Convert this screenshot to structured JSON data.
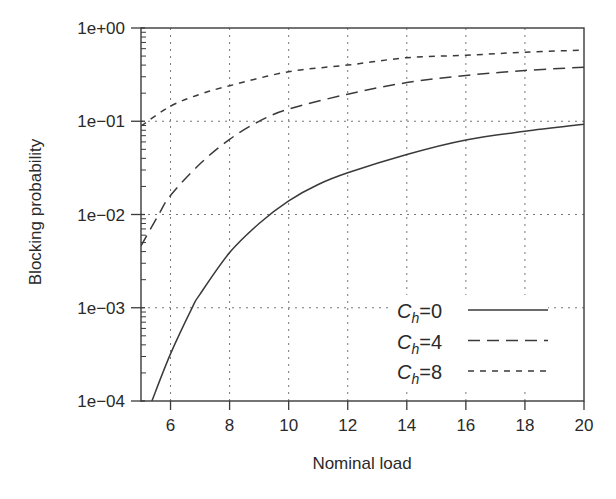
{
  "chart_data": {
    "type": "line",
    "title": "",
    "xlabel": "Nominal load",
    "ylabel": "Blocking probability",
    "xlim": [
      5,
      20
    ],
    "ylim": [
      0.0001,
      1
    ],
    "yscale": "log",
    "grid": true,
    "legend_position": "lower right",
    "x_ticks": [
      6,
      8,
      10,
      12,
      14,
      16,
      18,
      20
    ],
    "x_tick_labels": [
      "6",
      "8",
      "10",
      "12",
      "14",
      "16",
      "18",
      "20"
    ],
    "y_ticks": [
      1,
      0.1,
      0.01,
      0.001,
      0.0001
    ],
    "y_tick_labels": [
      "1e+00",
      "1e−01",
      "1e−02",
      "1e−03",
      "1e−04"
    ],
    "series": [
      {
        "name": "C_h=0",
        "label_main": "C",
        "label_sub": "h",
        "label_rest": "=0",
        "style": "solid",
        "color": "#3a3a3a",
        "x": [
          5.37,
          6,
          6.73,
          7,
          8,
          9,
          10,
          11,
          12,
          14,
          16,
          18,
          20
        ],
        "values": [
          0.0001,
          0.00032,
          0.001,
          0.0014,
          0.0039,
          0.008,
          0.014,
          0.021,
          0.028,
          0.044,
          0.063,
          0.078,
          0.093
        ]
      },
      {
        "name": "C_h=4",
        "label_main": "C",
        "label_sub": "h",
        "label_rest": "=4",
        "style": "long-dash",
        "color": "#3a3a3a",
        "x": [
          5,
          5.6,
          6,
          7,
          8,
          9,
          10,
          12,
          14,
          16,
          18,
          20
        ],
        "values": [
          0.0046,
          0.01,
          0.016,
          0.035,
          0.064,
          0.1,
          0.135,
          0.195,
          0.26,
          0.31,
          0.35,
          0.38
        ]
      },
      {
        "name": "C_h=8",
        "label_main": "C",
        "label_sub": "h",
        "label_rest": "=8",
        "style": "short-dash",
        "color": "#3a3a3a",
        "x": [
          5,
          6,
          7,
          8,
          10,
          12,
          14,
          16,
          18,
          20
        ],
        "values": [
          0.089,
          0.145,
          0.195,
          0.24,
          0.34,
          0.4,
          0.48,
          0.51,
          0.55,
          0.58
        ]
      }
    ]
  }
}
